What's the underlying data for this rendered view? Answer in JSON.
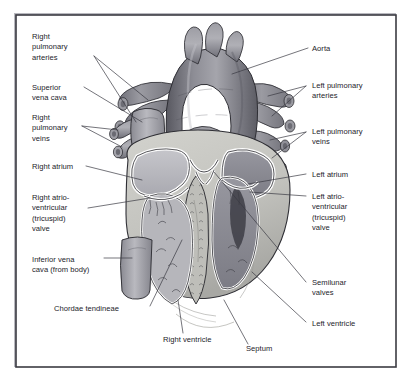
{
  "figure": {
    "frame": {
      "border_color": "#3b3b42",
      "background_color": "#ffffff",
      "shadow_color": "#b9b9bf"
    },
    "palette": {
      "page_background": "#ffffff",
      "text": "#24242a",
      "leader_line": "#3a3a42",
      "outline": "#2e2e34",
      "vessel_dark": "#6e6e76",
      "vessel_mid": "#8b8b93",
      "vessel_light": "#b4b4ba",
      "myocardium": "#c9c9c4",
      "myocardium_shade": "#a9a9a6",
      "chamber_light": "#bdbdc2",
      "chamber_dark": "#8e8e96",
      "endocardium_white": "#fdfdfd",
      "trabeculae": "#5d5d64"
    },
    "labels": [
      {
        "id": "right-pulmonary-arteries",
        "side": "left",
        "lines": [
          "Right",
          "pulmonary",
          "arteries"
        ],
        "text_x": 32,
        "text_y": 39
      },
      {
        "id": "superior-vena-cava",
        "side": "left",
        "lines": [
          "Superior",
          "vena cava"
        ],
        "text_x": 32,
        "text_y": 90
      },
      {
        "id": "right-pulmonary-veins",
        "side": "left",
        "lines": [
          "Right",
          "pulmonary",
          "veins"
        ],
        "text_x": 32,
        "text_y": 120
      },
      {
        "id": "right-atrium",
        "side": "left",
        "lines": [
          "Right atrium"
        ],
        "text_x": 32,
        "text_y": 169
      },
      {
        "id": "right-av-tricuspid-valve",
        "side": "left",
        "lines": [
          "Right atrio-",
          "ventricular",
          "(tricuspid)",
          "valve"
        ],
        "text_x": 32,
        "text_y": 200
      },
      {
        "id": "inferior-vena-cava",
        "side": "left",
        "lines": [
          "Inferior vena",
          "cava (from body)"
        ],
        "text_x": 32,
        "text_y": 262
      },
      {
        "id": "chordae-tendineae",
        "side": "left",
        "lines": [
          "Chordae tendineae"
        ],
        "text_x": 54,
        "text_y": 311
      },
      {
        "id": "right-ventricle",
        "side": "bottom",
        "lines": [
          "Right ventricle"
        ],
        "text_x": 163,
        "text_y": 342
      },
      {
        "id": "septum",
        "side": "bottom",
        "lines": [
          "Septum"
        ],
        "text_x": 246,
        "text_y": 351
      },
      {
        "id": "aorta",
        "side": "right",
        "lines": [
          "Aorta"
        ],
        "text_x": 312,
        "text_y": 51
      },
      {
        "id": "left-pulmonary-arteries",
        "side": "right",
        "lines": [
          "Left pulmonary",
          "arteries"
        ],
        "text_x": 312,
        "text_y": 88
      },
      {
        "id": "left-pulmonary-veins",
        "side": "right",
        "lines": [
          "Left pulmonary",
          "veins"
        ],
        "text_x": 312,
        "text_y": 134
      },
      {
        "id": "left-atrium",
        "side": "right",
        "lines": [
          "Left atrium"
        ],
        "text_x": 312,
        "text_y": 177
      },
      {
        "id": "left-av-tricuspid-valve",
        "side": "right",
        "lines": [
          "Left atrio-",
          "ventricular",
          "(tricuspid)",
          "valve"
        ],
        "text_x": 312,
        "text_y": 199
      },
      {
        "id": "semilunar-valves",
        "side": "right",
        "lines": [
          "Semilunar",
          "valves"
        ],
        "text_x": 312,
        "text_y": 285
      },
      {
        "id": "left-ventricle",
        "side": "right",
        "lines": [
          "Left ventricle"
        ],
        "text_x": 312,
        "text_y": 326
      }
    ]
  }
}
